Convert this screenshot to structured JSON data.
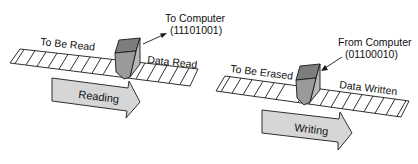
{
  "reading": {
    "left_label": "To Be Read",
    "right_label": "Data Read",
    "head_label_line1": "To Computer",
    "head_label_line2": "(11101001)",
    "arrow_label": "Reading"
  },
  "writing": {
    "left_label": "To Be Erased",
    "right_label": "Data Written",
    "head_label_line1": "From Computer",
    "head_label_line2": "(01100010)",
    "arrow_label": "Writing"
  },
  "colors": {
    "tape_fill": "#ffffff",
    "stroke": "#1a1a1a",
    "head_front": "#9a9a9a",
    "head_top": "#7d7d7d",
    "head_side": "#b8b8b8",
    "arrow_fill": "#d6d6d6"
  }
}
